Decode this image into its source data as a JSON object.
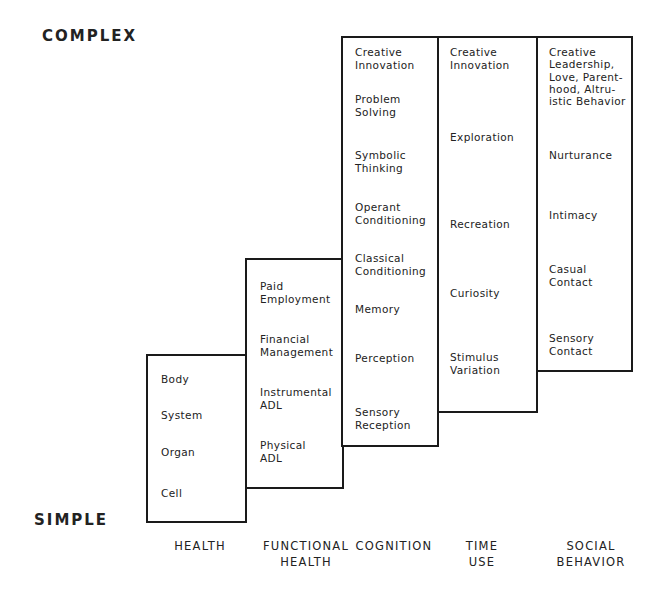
{
  "axis": {
    "top_label": "COMPLEX",
    "bottom_label": "SIMPLE"
  },
  "columns": [
    {
      "label": "HEALTH",
      "items": [
        "Body",
        "System",
        "Organ",
        "Cell"
      ]
    },
    {
      "label": "FUNCTIONAL\nHEALTH",
      "items": [
        "Paid\nEmployment",
        "Financial\nManagement",
        "Instrumental\nADL",
        "Physical\nADL"
      ]
    },
    {
      "label": "COGNITION",
      "items": [
        "Creative\nInnovation",
        "Problem\nSolving",
        "Symbolic\nThinking",
        "Operant\nConditioning",
        "Classical\nConditioning",
        "Memory",
        "Perception",
        "Sensory\nReception"
      ]
    },
    {
      "label": "TIME\nUSE",
      "items": [
        "Creative\nInnovation",
        "Exploration",
        "Recreation",
        "Curiosity",
        "Stimulus\nVariation"
      ]
    },
    {
      "label": "SOCIAL\nBEHAVIOR",
      "items": [
        "Creative\nLeadership,\nLove, Parent-\nhood, Altru-\nistic Behavior",
        "Nurturance",
        "Intimacy",
        "Casual\nContact",
        "Sensory\nContact"
      ]
    }
  ]
}
